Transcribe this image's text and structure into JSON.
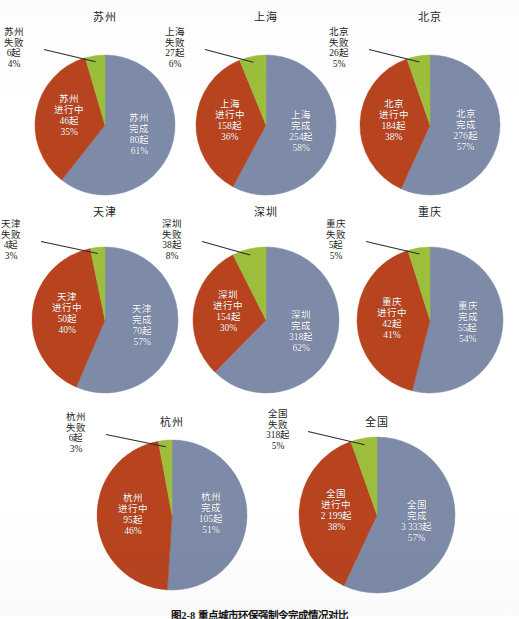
{
  "figure": {
    "caption": "图2-8  重点城市环保强制令完成情况对比",
    "colors": {
      "completed": "#7d8aa8",
      "ongoing": "#b8441f",
      "failed": "#9cbe3c",
      "background": "#ffffff",
      "text": "#1e1e1e",
      "slice_text": "#ffffff"
    },
    "unit_suffix": "起",
    "legend_names": {
      "completed": "完成",
      "ongoing": "进行中",
      "failed": "失败"
    }
  },
  "chart_data": [
    {
      "type": "pie",
      "title": "苏州",
      "categories": [
        "完成",
        "进行中",
        "失败"
      ],
      "values": [
        80,
        46,
        6
      ],
      "percents": [
        61,
        35,
        4
      ],
      "labels": [
        {
          "name": "苏州",
          "status": "完成",
          "count": "80起",
          "pct": "61%"
        },
        {
          "name": "苏州",
          "status": "进行中",
          "count": "46起",
          "pct": "35%"
        },
        {
          "name": "苏州",
          "status": "失败",
          "count": "6起",
          "pct": "4%"
        }
      ]
    },
    {
      "type": "pie",
      "title": "上海",
      "categories": [
        "完成",
        "进行中",
        "失败"
      ],
      "values": [
        254,
        158,
        27
      ],
      "percents": [
        58,
        36,
        6
      ],
      "labels": [
        {
          "name": "上海",
          "status": "完成",
          "count": "254起",
          "pct": "58%"
        },
        {
          "name": "上海",
          "status": "进行中",
          "count": "158起",
          "pct": "36%"
        },
        {
          "name": "上海",
          "status": "失败",
          "count": "27起",
          "pct": "6%"
        }
      ]
    },
    {
      "type": "pie",
      "title": "北京",
      "categories": [
        "完成",
        "进行中",
        "失败"
      ],
      "values": [
        276,
        184,
        26
      ],
      "percents": [
        57,
        38,
        5
      ],
      "labels": [
        {
          "name": "北京",
          "status": "完成",
          "count": "276起",
          "pct": "57%"
        },
        {
          "name": "北京",
          "status": "进行中",
          "count": "184起",
          "pct": "38%"
        },
        {
          "name": "北京",
          "status": "失败",
          "count": "26起",
          "pct": "5%"
        }
      ]
    },
    {
      "type": "pie",
      "title": "天津",
      "categories": [
        "完成",
        "进行中",
        "失败"
      ],
      "values": [
        70,
        50,
        4
      ],
      "percents": [
        57,
        40,
        3
      ],
      "labels": [
        {
          "name": "天津",
          "status": "完成",
          "count": "70起",
          "pct": "57%"
        },
        {
          "name": "天津",
          "status": "进行中",
          "count": "50起",
          "pct": "40%"
        },
        {
          "name": "天津",
          "status": "失败",
          "count": "4起",
          "pct": "3%"
        }
      ]
    },
    {
      "type": "pie",
      "title": "深圳",
      "categories": [
        "完成",
        "进行中",
        "失败"
      ],
      "values": [
        318,
        154,
        38
      ],
      "percents": [
        62,
        30,
        8
      ],
      "labels": [
        {
          "name": "深圳",
          "status": "完成",
          "count": "318起",
          "pct": "62%"
        },
        {
          "name": "深圳",
          "status": "进行中",
          "count": "154起",
          "pct": "30%"
        },
        {
          "name": "深圳",
          "status": "失败",
          "count": "38起",
          "pct": "8%"
        }
      ]
    },
    {
      "type": "pie",
      "title": "重庆",
      "categories": [
        "完成",
        "进行中",
        "失败"
      ],
      "values": [
        55,
        42,
        5
      ],
      "percents": [
        54,
        41,
        5
      ],
      "labels": [
        {
          "name": "重庆",
          "status": "完成",
          "count": "55起",
          "pct": "54%"
        },
        {
          "name": "重庆",
          "status": "进行中",
          "count": "42起",
          "pct": "41%"
        },
        {
          "name": "重庆",
          "status": "失败",
          "count": "5起",
          "pct": "5%"
        }
      ]
    },
    {
      "type": "pie",
      "title": "杭州",
      "categories": [
        "完成",
        "进行中",
        "失败"
      ],
      "values": [
        105,
        95,
        6
      ],
      "percents": [
        51,
        46,
        3
      ],
      "labels": [
        {
          "name": "杭州",
          "status": "完成",
          "count": "105起",
          "pct": "51%"
        },
        {
          "name": "杭州",
          "status": "进行中",
          "count": "95起",
          "pct": "46%"
        },
        {
          "name": "杭州",
          "status": "失败",
          "count": "6起",
          "pct": "3%"
        }
      ]
    },
    {
      "type": "pie",
      "title": "全国",
      "categories": [
        "完成",
        "进行中",
        "失败"
      ],
      "values": [
        3333,
        2199,
        318
      ],
      "percents": [
        57,
        38,
        5
      ],
      "labels": [
        {
          "name": "全国",
          "status": "完成",
          "count": "3 333起",
          "pct": "57%"
        },
        {
          "name": "全国",
          "status": "进行中",
          "count": "2 199起",
          "pct": "38%"
        },
        {
          "name": "全国",
          "status": "失败",
          "count": "318起",
          "pct": "5%"
        }
      ]
    }
  ]
}
